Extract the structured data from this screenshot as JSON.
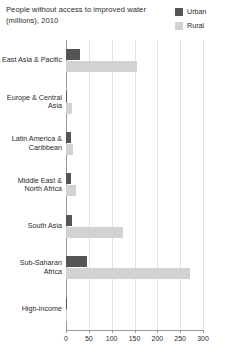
{
  "chart_data": {
    "type": "bar",
    "orientation": "horizontal",
    "title": "People without access to improved water (millions), 2010",
    "xlabel": "",
    "ylabel": "",
    "xlim": [
      0,
      300
    ],
    "xticks": [
      0,
      50,
      100,
      150,
      200,
      250,
      300
    ],
    "xtick_labels": [
      "0",
      "50",
      "100",
      "150",
      "200",
      "250",
      "300"
    ],
    "grid": true,
    "grid_axis": "x",
    "legend_position": "top-right",
    "categories": [
      "East Asia & Pacific",
      "Europe & Central Asia",
      "Latin America & Caribbean",
      "Middle East & North Africa",
      "South Asia",
      "Sub-Saharan Africa",
      "High-income"
    ],
    "series": [
      {
        "name": "Urban",
        "color": "#555555",
        "values": [
          30,
          3,
          12,
          10,
          13,
          45,
          1
        ]
      },
      {
        "name": "Rural",
        "color": "#d2d2d2",
        "values": [
          155,
          14,
          16,
          21,
          125,
          272,
          1
        ]
      }
    ]
  },
  "legend": {
    "items": [
      {
        "label": "Urban",
        "color": "#555555"
      },
      {
        "label": "Rural",
        "color": "#d2d2d2"
      }
    ]
  },
  "colors": {
    "urban": "#555555",
    "rural": "#d2d2d2",
    "gridline": "#e2e2e2",
    "axis": "#9a9a9a",
    "text": "#2b2b2b",
    "background": "#ffffff"
  }
}
